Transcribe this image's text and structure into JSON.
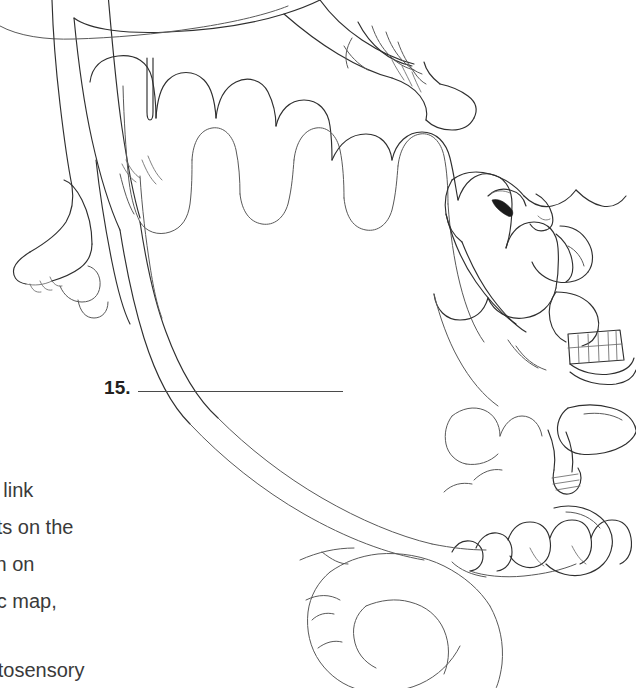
{
  "page": {
    "background_color": "#ffffff",
    "width": 636,
    "height": 688,
    "ink_color": "#2f2f2f",
    "text_color": "#3a3a3a"
  },
  "illustration": {
    "name": "sensory-homunculus-diagram",
    "description": "Line drawing of a somatosensory homunculus draped over a cross-section of the cerebral cortex, showing leg, foot and toes at upper left, hand and fingers at upper centre, face with eye, nose, lips and teeth at right, and tongue and toes at lower right.",
    "style": "black-and-white contour line art",
    "parts": [
      "cortical-gyri-folds",
      "leg",
      "foot",
      "toes",
      "hand",
      "fingers",
      "thumb",
      "forearm",
      "head",
      "eye",
      "nose",
      "lips",
      "teeth",
      "tongue",
      "jaw"
    ]
  },
  "blank_item": {
    "number": "15.",
    "answer_value": "",
    "rule_color": "#4a4a4a"
  },
  "caption": {
    "lines": [
      "the link",
      "oints on the",
      "own on",
      "opic map,"
    ],
    "tail_lines": [
      "matosensory"
    ],
    "note": "left edge of the paragraph is cropped off the page"
  }
}
